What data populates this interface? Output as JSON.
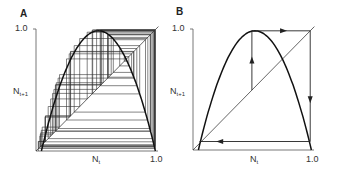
{
  "figure": {
    "panels": [
      {
        "id": "A",
        "label": "A",
        "y_max_label": "1.0",
        "x_max_label": "1.0",
        "ylabel_main": "N",
        "ylabel_sub": "t+1",
        "xlabel_main": "N",
        "xlabel_sub": "t",
        "description": "Cobweb plot of chaotic dynamics of the logistic map"
      },
      {
        "id": "B",
        "label": "B",
        "y_max_label": "1.0",
        "x_max_label": "1.0",
        "ylabel_main": "N",
        "ylabel_sub": "t+1",
        "xlabel_main": "N",
        "xlabel_sub": "t",
        "description": "Cobweb plot showing iteration path with arrows"
      }
    ]
  },
  "chart_data": [
    {
      "type": "line",
      "title": "A",
      "xlabel": "N_t",
      "ylabel": "N_{t+1}",
      "xlim": [
        0,
        1.0
      ],
      "ylim": [
        0,
        1.0
      ],
      "series": [
        {
          "name": "map curve",
          "function": "N_{t+1} = 4 N_t (1 - N_t)"
        },
        {
          "name": "diagonal",
          "function": "N_{t+1} = N_t"
        },
        {
          "name": "cobweb",
          "description": "many iterations, chaotic"
        }
      ]
    },
    {
      "type": "line",
      "title": "B",
      "xlabel": "N_t",
      "ylabel": "N_{t+1}",
      "xlim": [
        0,
        1.0
      ],
      "ylim": [
        0,
        1.0
      ],
      "series": [
        {
          "name": "map curve",
          "function": "N_{t+1} = 4 N_t (1 - N_t)"
        },
        {
          "name": "diagonal",
          "function": "N_{t+1} = N_t"
        },
        {
          "name": "cobweb path",
          "points": [
            [
              0.5,
              0.5
            ],
            [
              0.5,
              1.0
            ],
            [
              1.0,
              1.0
            ],
            [
              1.0,
              0.05
            ],
            [
              0.05,
              0.05
            ]
          ]
        }
      ]
    }
  ]
}
